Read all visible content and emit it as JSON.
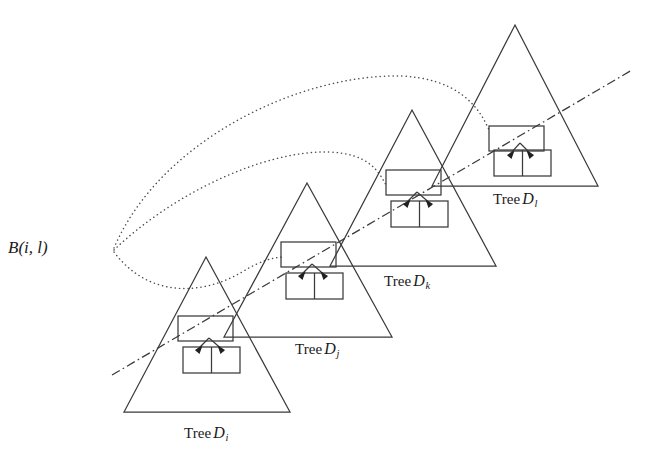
{
  "figure": {
    "title_text": "",
    "background_color": "#ffffff",
    "stroke_color": "#3a3a3a",
    "dotted_color": "#4d4d4d",
    "dashdot_color": "#3a3a3a",
    "labels": {
      "b_node": {
        "prefix": "B",
        "open": "(",
        "arg1": "i",
        "comma": ",",
        "arg2": "l",
        "close": ")",
        "full": "B(i, l)",
        "x": 8,
        "y": 238
      },
      "trees": [
        {
          "id": "tree-i",
          "word": "Tree",
          "symbol": "D",
          "subscript": "i",
          "full": "Tree D_i",
          "x": 184,
          "y": 424
        },
        {
          "id": "tree-j",
          "word": "Tree",
          "symbol": "D",
          "subscript": "j",
          "full": "Tree D_j",
          "x": 295,
          "y": 340
        },
        {
          "id": "tree-k",
          "word": "Tree",
          "symbol": "D",
          "subscript": "k",
          "full": "Tree D_k",
          "x": 384,
          "y": 272
        },
        {
          "id": "tree-l",
          "word": "Tree",
          "symbol": "D",
          "subscript": "l",
          "full": "Tree D_l",
          "x": 493,
          "y": 190
        }
      ]
    },
    "triangles": [
      {
        "id": "triangle-i",
        "apex_x": 206,
        "apex_y": 257,
        "base_left_x": 124,
        "base_right_x": 290,
        "base_y": 412
      },
      {
        "id": "triangle-j",
        "apex_x": 307,
        "apex_y": 183,
        "base_left_x": 224,
        "base_right_x": 392,
        "base_y": 337
      },
      {
        "id": "triangle-k",
        "apex_x": 412,
        "apex_y": 110,
        "base_left_x": 330,
        "base_right_x": 496,
        "base_y": 266
      },
      {
        "id": "triangle-l",
        "apex_x": 515,
        "apex_y": 25,
        "base_left_x": 432,
        "base_right_x": 598,
        "base_y": 186
      }
    ],
    "nodes": [
      {
        "id": "node-i",
        "upper_x": 178,
        "upper_y": 316,
        "upper_w": 54,
        "upper_h": 25,
        "lower_x": 183,
        "lower_y": 347,
        "lower_w": 56,
        "lower_h": 26
      },
      {
        "id": "node-j",
        "upper_x": 281,
        "upper_y": 242,
        "upper_w": 54,
        "upper_h": 25,
        "lower_x": 286,
        "lower_y": 273,
        "lower_w": 56,
        "lower_h": 26
      },
      {
        "id": "node-k",
        "upper_x": 386,
        "upper_y": 170,
        "upper_w": 54,
        "upper_h": 25,
        "lower_x": 391,
        "lower_y": 201,
        "lower_w": 56,
        "lower_h": 26
      },
      {
        "id": "node-l",
        "upper_x": 489,
        "upper_y": 126,
        "upper_w": 54,
        "upper_h": 25,
        "lower_x": 494,
        "lower_y": 150,
        "lower_w": 56,
        "lower_h": 26
      }
    ],
    "arcs": [
      {
        "id": "arc-to-j",
        "from_x": 113,
        "from_y": 250,
        "to_x": 281,
        "to_y": 258,
        "label": "B(i,l) to Tree D_j"
      },
      {
        "id": "arc-to-k",
        "from_x": 113,
        "from_y": 250,
        "to_x": 386,
        "to_y": 186,
        "label": "B(i,l) to Tree D_k"
      },
      {
        "id": "arc-to-l",
        "from_x": 113,
        "from_y": 250,
        "to_x": 489,
        "to_y": 132,
        "label": "B(i,l) to Tree D_l"
      }
    ],
    "axis_line": {
      "id": "dash-dot-axis",
      "x1": 112,
      "y1": 375,
      "x2": 632,
      "y2": 70
    }
  }
}
